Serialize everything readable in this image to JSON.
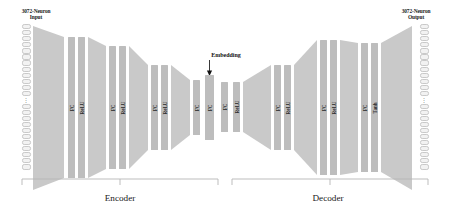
{
  "diagram": {
    "type": "autoencoder-architecture",
    "title": "",
    "input": {
      "label": "3072-Neuron\nInput",
      "label_line1": "3072-Neuron",
      "label_line2": "Input",
      "neuron_count_text": "3072",
      "ellipsis": "⋮",
      "cells_above_ellipsis": 12,
      "cells_below_ellipsis": 11
    },
    "output": {
      "label_line1": "3072-Neuron",
      "label_line2": "Output",
      "neuron_count_text": "3072",
      "ellipsis": "⋮",
      "cells_above_ellipsis": 12,
      "cells_below_ellipsis": 11
    },
    "embedding": {
      "label": "Embedding",
      "points_to_layer_index": 9
    },
    "sections": [
      {
        "name": "encoder",
        "label": "Encoder"
      },
      {
        "name": "decoder",
        "label": "Decoder"
      }
    ],
    "colors": {
      "bar": "#bdbdbd",
      "trapezoid": "#c9c9c9",
      "neuron_fill": "#f2f2f2",
      "neuron_border": "#c9c9c9",
      "text": "#1a1a1a",
      "bracket": "#b5b5b5",
      "background": "#ffffff"
    },
    "layers": [
      {
        "index": 0,
        "label": "FC",
        "kind": "fc",
        "section": "encoder",
        "x": 68,
        "y": 37,
        "w": 7,
        "h": 141
      },
      {
        "index": 1,
        "label": "ReLU",
        "kind": "relu",
        "section": "encoder",
        "x": 78,
        "y": 37,
        "w": 7,
        "h": 141
      },
      {
        "index": 2,
        "label": "FC",
        "kind": "fc",
        "section": "encoder",
        "x": 109,
        "y": 46,
        "w": 7,
        "h": 123
      },
      {
        "index": 3,
        "label": "ReLU",
        "kind": "relu",
        "section": "encoder",
        "x": 119,
        "y": 46,
        "w": 7,
        "h": 123
      },
      {
        "index": 4,
        "label": "FC",
        "kind": "fc",
        "section": "encoder",
        "x": 151,
        "y": 65,
        "w": 7,
        "h": 85
      },
      {
        "index": 5,
        "label": "ReLU",
        "kind": "relu",
        "section": "encoder",
        "x": 161,
        "y": 65,
        "w": 7,
        "h": 85
      },
      {
        "index": 6,
        "label": "FC",
        "kind": "fc",
        "section": "encoder",
        "x": 193,
        "y": 80,
        "w": 7,
        "h": 55
      },
      {
        "index": 7,
        "label": "FC",
        "kind": "fc",
        "section": "embedding",
        "x": 205,
        "y": 75,
        "w": 9,
        "h": 65
      },
      {
        "index": 8,
        "label": "FC",
        "kind": "fc",
        "section": "decoder",
        "x": 221,
        "y": 82,
        "w": 7,
        "h": 50
      },
      {
        "index": 9,
        "label": "ReLU",
        "kind": "relu",
        "section": "decoder",
        "x": 233,
        "y": 82,
        "w": 7,
        "h": 50
      },
      {
        "index": 10,
        "label": "FC",
        "kind": "fc",
        "section": "decoder",
        "x": 274,
        "y": 65,
        "w": 7,
        "h": 85
      },
      {
        "index": 11,
        "label": "ReLU",
        "kind": "relu",
        "section": "decoder",
        "x": 284,
        "y": 65,
        "w": 7,
        "h": 85
      },
      {
        "index": 12,
        "label": "FC",
        "kind": "fc",
        "section": "decoder",
        "x": 320,
        "y": 40,
        "w": 7,
        "h": 135
      },
      {
        "index": 13,
        "label": "ReLU",
        "kind": "relu",
        "section": "decoder",
        "x": 330,
        "y": 40,
        "w": 7,
        "h": 135
      },
      {
        "index": 14,
        "label": "FC",
        "kind": "fc",
        "section": "decoder",
        "x": 361,
        "y": 43,
        "w": 7,
        "h": 129
      },
      {
        "index": 15,
        "label": "Tanh",
        "kind": "tanh",
        "section": "decoder",
        "x": 371,
        "y": 43,
        "w": 7,
        "h": 129
      }
    ],
    "trapezoids": [
      {
        "index": 0,
        "direction": "narrowing",
        "section": "encoder"
      },
      {
        "index": 1,
        "direction": "narrowing",
        "section": "encoder"
      },
      {
        "index": 2,
        "direction": "narrowing",
        "section": "encoder"
      },
      {
        "index": 3,
        "direction": "narrowing",
        "section": "encoder"
      },
      {
        "index": 4,
        "direction": "widening",
        "section": "decoder"
      },
      {
        "index": 5,
        "direction": "widening",
        "section": "decoder"
      },
      {
        "index": 6,
        "direction": "widening",
        "section": "decoder"
      },
      {
        "index": 7,
        "direction": "widening",
        "section": "decoder"
      }
    ]
  }
}
